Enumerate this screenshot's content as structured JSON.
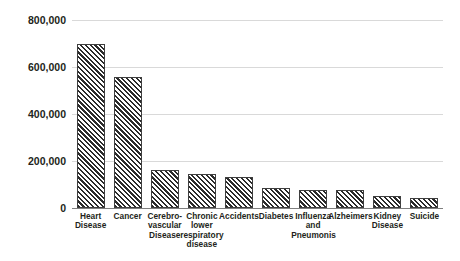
{
  "chart_data": {
    "type": "bar",
    "title": "",
    "subtitle": "",
    "xlabel": "",
    "ylabel": "",
    "ylim": [
      0,
      800000
    ],
    "yticks": [
      "0",
      "200,000",
      "400,000",
      "600,000",
      "800,000"
    ],
    "ytick_values": [
      0,
      200000,
      400000,
      600000,
      800000
    ],
    "grid": true,
    "legend": false,
    "legend_position": "none",
    "bar_style": {
      "fill": "diagonal-hatch",
      "hatch_color": "#2b2b2b",
      "background_color": "#ffffff",
      "border_color": "#3f3f3f"
    },
    "categories": [
      "Heart Disease",
      "Cancer",
      "Cerebro-vascular Disease",
      "Chronic lower respiratory disease",
      "Accidents",
      "Diabetes",
      "Influenza and Pneumonis",
      "Alzheimers",
      "Kidney Disease",
      "Suicide"
    ],
    "category_lines": [
      [
        "Heart",
        "Disease"
      ],
      [
        "Cancer"
      ],
      [
        "Cerebro-",
        "vascular",
        "Disease"
      ],
      [
        "Chronic",
        "lower",
        "respiratory",
        "disease"
      ],
      [
        "Accidents"
      ],
      [
        "Diabetes"
      ],
      [
        "Influenza",
        "and",
        "Pneumonis"
      ],
      [
        "Alzheimers"
      ],
      [
        "Kidney",
        "Disease"
      ],
      [
        "Suicide"
      ]
    ],
    "values": [
      697000,
      556000,
      160000,
      145000,
      130000,
      85000,
      76000,
      75000,
      51000,
      44000
    ]
  }
}
